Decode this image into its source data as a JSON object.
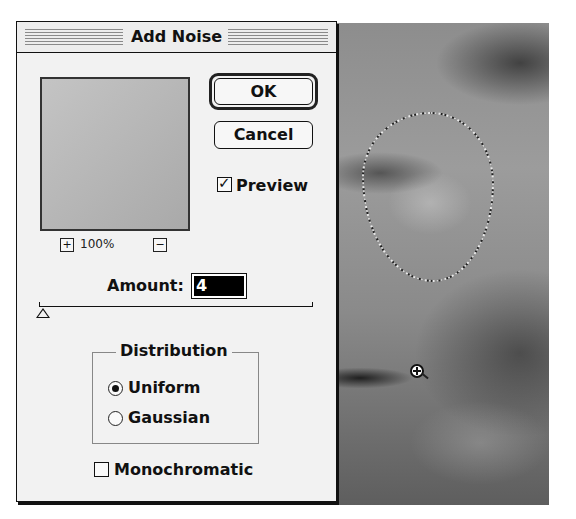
{
  "dialog": {
    "title": "Add Noise",
    "ok_label": "OK",
    "cancel_label": "Cancel",
    "preview": {
      "label": "Preview",
      "checked": true
    },
    "zoom": {
      "plus": "+",
      "minus": "−",
      "level": "100%"
    },
    "amount": {
      "label": "Amount:",
      "value": "4"
    },
    "slider": {
      "value": 4
    },
    "distribution": {
      "title": "Distribution",
      "options": [
        {
          "label": "Uniform",
          "selected": true
        },
        {
          "label": "Gaussian",
          "selected": false
        }
      ]
    },
    "monochromatic": {
      "label": "Monochromatic",
      "checked": false
    }
  },
  "canvas": {
    "description": "grayscale face photo with marching-ants selection",
    "cursor": "zoom-in-icon"
  }
}
